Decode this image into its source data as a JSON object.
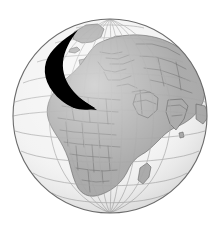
{
  "figure": {
    "name": "world-globe-with-arrow",
    "title": "Orthographic globe showing Europe, Africa and Asia with a curved arrow",
    "background_color": "#ffffff"
  },
  "globe": {
    "projection": "orthographic",
    "center_x": 110,
    "center_y": 116,
    "radius": 97,
    "ocean_color": "#f2f2f2",
    "land_color": "#a0a0a0",
    "land_stroke_color": "#4a4a4a",
    "outline_color": "#6b6b6b",
    "graticule_color": "#9a9a9a",
    "graticule_spacing_degrees": 15,
    "center_longitude": 20,
    "center_latitude": 18,
    "shading": "subtle radial limb darkening"
  },
  "arrow": {
    "label": "curved-arrow",
    "color": "#000000",
    "shape": "crescent swoosh",
    "origin_region": "North Atlantic / Northwest Europe",
    "target_region": "Eastern Mediterranean / Middle East",
    "start_point": [
      78,
      30
    ],
    "control_points": [
      [
        46,
        56
      ],
      [
        58,
        92
      ]
    ],
    "tip_point": [
      95,
      108
    ],
    "direction": "southeast"
  },
  "landmasses": [
    {
      "name": "europe"
    },
    {
      "name": "africa"
    },
    {
      "name": "asia"
    },
    {
      "name": "greenland"
    },
    {
      "name": "arabia"
    },
    {
      "name": "india"
    },
    {
      "name": "madagascar"
    },
    {
      "name": "scandinavia"
    },
    {
      "name": "british-isles"
    },
    {
      "name": "iceland"
    },
    {
      "name": "sri-lanka"
    }
  ],
  "oceans": [
    {
      "name": "arctic-ocean"
    },
    {
      "name": "atlantic-ocean"
    },
    {
      "name": "indian-ocean"
    },
    {
      "name": "mediterranean-sea"
    }
  ]
}
